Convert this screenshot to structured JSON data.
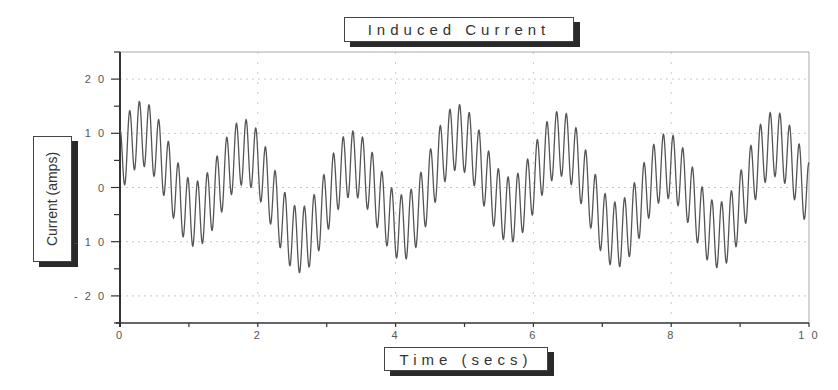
{
  "chart_data": {
    "type": "line",
    "title": "Induced Current",
    "xlabel": "Time (secs)",
    "ylabel": "Current (amps)",
    "xlim": [
      0,
      10
    ],
    "ylim": [
      -25,
      25
    ],
    "xticks": [
      0,
      2,
      4,
      6,
      8,
      10
    ],
    "xtick_labels": [
      "0",
      "2",
      "4",
      "6",
      "8",
      "1 0"
    ],
    "yticks": [
      20,
      10,
      0,
      -10,
      -20
    ],
    "ytick_labels": [
      "2 0",
      "1 0",
      "0",
      "- 1 0",
      "- 2 0"
    ],
    "grid": true,
    "legend": null,
    "series": [
      {
        "name": "Induced Current",
        "color": "#555555",
        "model": "sum of sinusoids",
        "components": [
          {
            "amp": 7,
            "freq": 0.655,
            "phase": 0.3
          },
          {
            "amp": 3,
            "freq": 0.2,
            "phase": 1.0
          },
          {
            "amp": 6,
            "freq": 7.1,
            "phase": 1.6
          }
        ],
        "approx_major_peaks": [
          {
            "t": 0.77,
            "y": 18
          },
          {
            "t": 3.06,
            "y": 18
          },
          {
            "t": 4.54,
            "y": 18
          },
          {
            "t": 6.88,
            "y": 20
          },
          {
            "t": 8.43,
            "y": 17
          },
          {
            "t": 9.2,
            "y": 17
          }
        ],
        "approx_major_troughs": [
          {
            "t": 1.15,
            "y": -19
          },
          {
            "t": 2.66,
            "y": -18
          },
          {
            "t": 4.98,
            "y": -18
          },
          {
            "t": 6.52,
            "y": -18
          },
          {
            "t": 8.81,
            "y": -20
          }
        ]
      }
    ]
  }
}
